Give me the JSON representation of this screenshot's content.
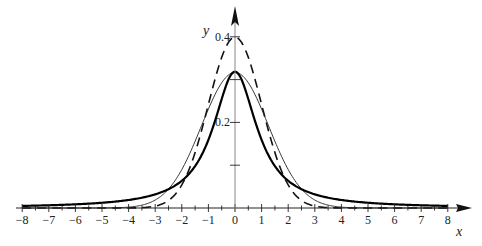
{
  "chart_data": {
    "type": "line",
    "title": "",
    "xlabel": "x",
    "ylabel": "y",
    "xlim": [
      -8,
      8
    ],
    "ylim": [
      0,
      0.42
    ],
    "grid": false,
    "legend": null,
    "x_ticks": [
      -8,
      -7,
      -6,
      -5,
      -4,
      -3,
      -2,
      -1,
      0,
      1,
      2,
      3,
      4,
      5,
      6,
      7,
      8
    ],
    "x_tick_labels": [
      "−8",
      "−7",
      "−6",
      "−5",
      "−4",
      "−3",
      "−2",
      "−1",
      "0",
      "1",
      "2",
      "3",
      "4",
      "5",
      "6",
      "7",
      "8"
    ],
    "y_ticks": [
      0.1,
      0.2,
      0.3,
      0.4
    ],
    "y_tick_labels": [
      "",
      "0.2",
      "",
      "0.4"
    ],
    "series": [
      {
        "name": "standard normal (dashed)",
        "style": "dashed",
        "stroke_width": 1.6,
        "color": "#111111",
        "x": [
          -8,
          -4,
          -3,
          -2.5,
          -2,
          -1.5,
          -1,
          -0.5,
          0,
          0.5,
          1,
          1.5,
          2,
          2.5,
          3,
          4,
          8
        ],
        "y": [
          0,
          0.0001,
          0.0044,
          0.0175,
          0.054,
          0.1295,
          0.242,
          0.352,
          0.399,
          0.352,
          0.242,
          0.1295,
          0.054,
          0.0175,
          0.0044,
          0.0001,
          0
        ]
      },
      {
        "name": "normal, sigma≈1.26 (thin solid)",
        "style": "solid",
        "stroke_width": 0.9,
        "color": "#222222",
        "x": [
          -8,
          -5,
          -4,
          -3,
          -2.5,
          -2,
          -1.5,
          -1,
          -0.5,
          0,
          0.5,
          1,
          1.5,
          2,
          2.5,
          3,
          4,
          5,
          8
        ],
        "y": [
          0,
          0.0001,
          0.002,
          0.0186,
          0.0442,
          0.0897,
          0.155,
          0.231,
          0.292,
          0.316,
          0.292,
          0.231,
          0.155,
          0.0897,
          0.0442,
          0.0186,
          0.002,
          0.0001,
          0
        ]
      },
      {
        "name": "Cauchy (thick solid)",
        "style": "solid",
        "stroke_width": 2.2,
        "color": "#000000",
        "x": [
          -8,
          -7,
          -6,
          -5,
          -4,
          -3,
          -2.5,
          -2,
          -1.5,
          -1,
          -0.5,
          0,
          0.5,
          1,
          1.5,
          2,
          2.5,
          3,
          4,
          5,
          6,
          7,
          8
        ],
        "y": [
          0.0049,
          0.0064,
          0.0086,
          0.0122,
          0.0187,
          0.0318,
          0.0439,
          0.0637,
          0.0979,
          0.159,
          0.2546,
          0.318,
          0.2546,
          0.159,
          0.0979,
          0.0637,
          0.0439,
          0.0318,
          0.0187,
          0.0122,
          0.0086,
          0.0064,
          0.0049
        ]
      }
    ]
  },
  "layout": {
    "origin_px": [
      235,
      208
    ],
    "x_unit_px": 26.6,
    "y_unit_px": 428
  }
}
